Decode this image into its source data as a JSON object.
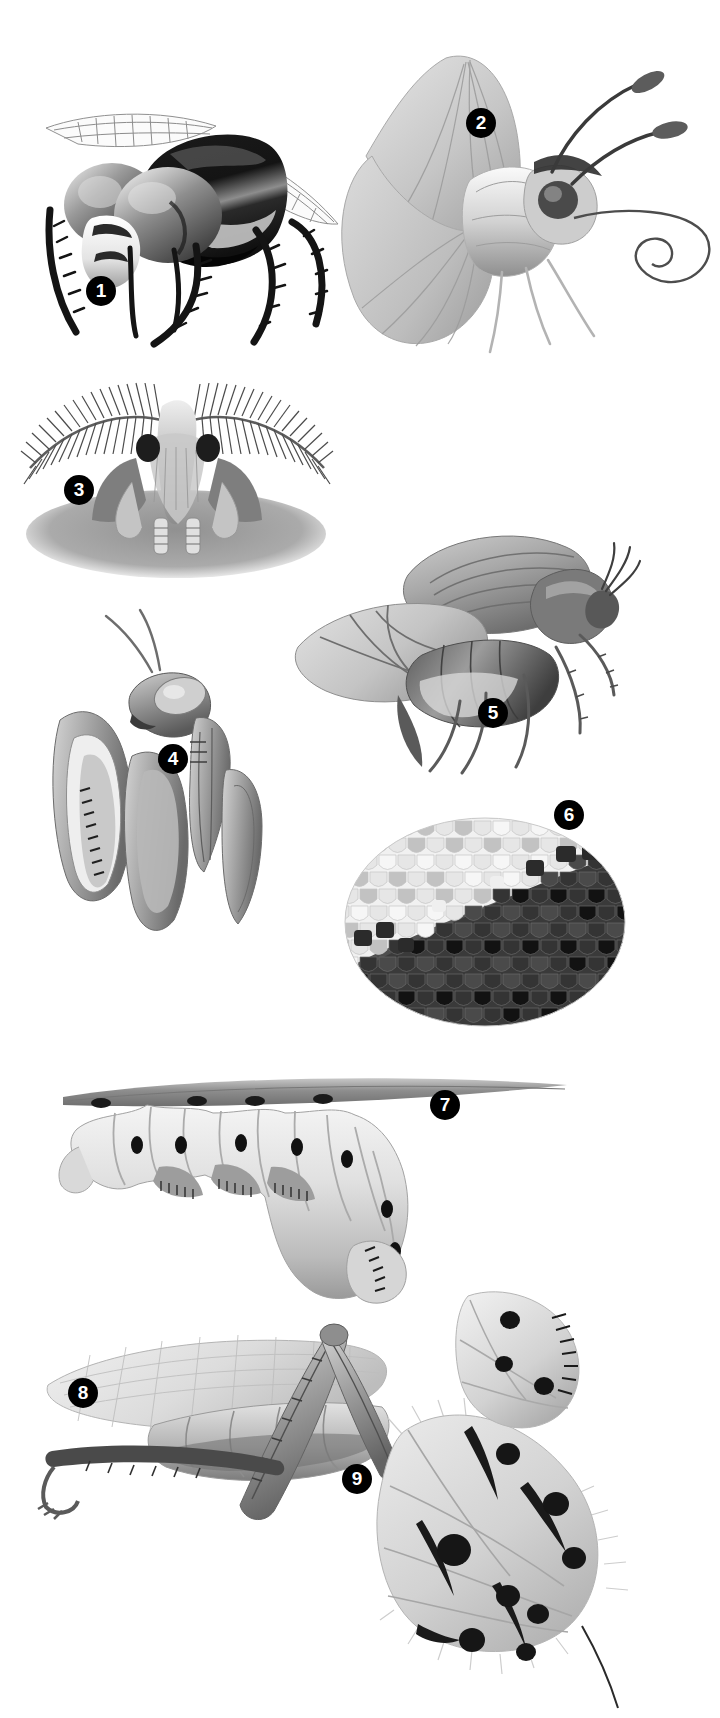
{
  "plate": {
    "title": "Insect anatomy illustration plate",
    "background_color": "#ffffff",
    "ink_color": "#000000",
    "width": 720,
    "height": 1718,
    "style": "grayscale airbrush / pencil scientific illustration"
  },
  "markers": [
    {
      "id": "1",
      "label": "1",
      "x": 86,
      "y": 276,
      "subject": "fly-head",
      "caption": "Fly head with compound eyes and bristly legs"
    },
    {
      "id": "2",
      "label": "2",
      "x": 466,
      "y": 108,
      "subject": "butterfly",
      "caption": "Butterfly with clubbed antennae and coiled proboscis"
    },
    {
      "id": "3",
      "label": "3",
      "x": 64,
      "y": 475,
      "subject": "moth-antennae",
      "caption": "Moth with feathery (plumose) antennae"
    },
    {
      "id": "4",
      "label": "4",
      "x": 158,
      "y": 744,
      "subject": "praying-mantis",
      "caption": "Praying mantis head and raptorial forelegs"
    },
    {
      "id": "5",
      "label": "5",
      "x": 478,
      "y": 698,
      "subject": "beetle-in-flight",
      "caption": "Beetle in flight with elytra raised"
    },
    {
      "id": "6",
      "label": "6",
      "x": 554,
      "y": 800,
      "subject": "wing-scales",
      "caption": "Close-up of butterfly wing scales"
    },
    {
      "id": "7",
      "label": "7",
      "x": 430,
      "y": 1090,
      "subject": "caterpillar",
      "caption": "Caterpillar hanging beneath a twig"
    },
    {
      "id": "8",
      "label": "8",
      "x": 68,
      "y": 1378,
      "subject": "grasshopper-leg",
      "caption": "Grasshopper hind leg and folded wing"
    },
    {
      "id": "9",
      "label": "9",
      "x": 342,
      "y": 1464,
      "subject": "spotted-moth-wing",
      "caption": "Spotted moth abdomen and hindwing"
    }
  ],
  "figures": [
    {
      "id": "fig-1",
      "name": "fly-head",
      "number": "1"
    },
    {
      "id": "fig-2",
      "name": "butterfly",
      "number": "2"
    },
    {
      "id": "fig-3",
      "name": "moth-antennae",
      "number": "3"
    },
    {
      "id": "fig-4",
      "name": "praying-mantis",
      "number": "4"
    },
    {
      "id": "fig-5",
      "name": "beetle-in-flight",
      "number": "5"
    },
    {
      "id": "fig-6",
      "name": "wing-scales",
      "number": "6"
    },
    {
      "id": "fig-7",
      "name": "caterpillar",
      "number": "7"
    },
    {
      "id": "fig-8",
      "name": "grasshopper-leg",
      "number": "8"
    },
    {
      "id": "fig-9",
      "name": "spotted-moth-wing",
      "number": "9"
    }
  ],
  "palette": {
    "black": "#111111",
    "dark": "#3a3a3a",
    "mid": "#7c7c7c",
    "light": "#b9b9b9",
    "pale": "#d8d8d8",
    "faint": "#ededed",
    "white": "#ffffff"
  }
}
